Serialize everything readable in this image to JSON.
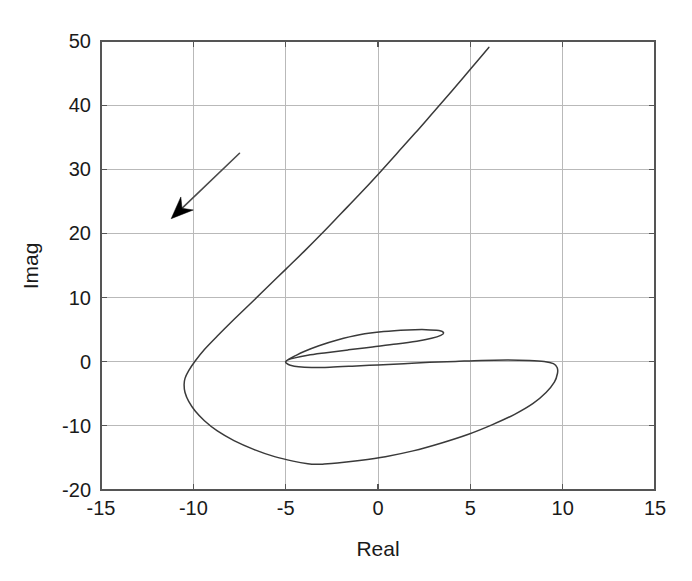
{
  "chart_data": {
    "type": "line",
    "title": "",
    "subtitle": "",
    "xlabel": "Real",
    "ylabel": "Imag",
    "xlim": [
      -15,
      15
    ],
    "ylim": [
      -20,
      50
    ],
    "xticks": [
      -15,
      -10,
      -5,
      0,
      5,
      10,
      15
    ],
    "yticks": [
      -20,
      -10,
      0,
      10,
      20,
      30,
      40,
      50
    ],
    "xtick_labels": [
      "-15",
      "-10",
      "-5",
      "0",
      "5",
      "10",
      "15"
    ],
    "ytick_labels": [
      "-20",
      "-10",
      "0",
      "10",
      "20",
      "30",
      "40",
      "50"
    ],
    "grid": true,
    "legend": null,
    "legend_position": "none",
    "curve_color": "#3a3a3a",
    "grid_color": "#b9b9b9",
    "frame_color": "#555555",
    "background_color": "#ffffff",
    "annotations": [
      {
        "name": "direction-arrow",
        "type": "arrow",
        "label": "",
        "from": [
          -7.5,
          32.5
        ],
        "to": [
          -11.2,
          22.3
        ],
        "color": "#000000"
      }
    ],
    "series": [
      {
        "name": "nyquist-locus",
        "comment": "Nyquist locus: upper tail descending from (6,49), swinging left past (-10.5,-1), around the bottom to (9.7,-1.5), then back left along a thin inner loop that closes at the cusp (-5,0).",
        "x": [
          6.0,
          5.0,
          4.0,
          3.0,
          2.0,
          1.0,
          0.0,
          -1.0,
          -2.0,
          -3.0,
          -4.0,
          -5.0,
          -6.0,
          -7.0,
          -7.9,
          -8.7,
          -9.4,
          -9.9,
          -10.25,
          -10.45,
          -10.5,
          -10.45,
          -10.25,
          -9.9,
          -9.4,
          -8.7,
          -7.8,
          -6.7,
          -5.6,
          -4.6,
          -3.8,
          -3.3,
          -3.0,
          -2.2,
          -1.0,
          0.4,
          1.9,
          3.4,
          4.9,
          6.2,
          7.4,
          8.4,
          9.1,
          9.55,
          9.72,
          9.7,
          9.5,
          9.0,
          8.2,
          7.0,
          5.6,
          4.2,
          2.8,
          1.4,
          0.0,
          -1.4,
          -2.6,
          -3.6,
          -4.3,
          -4.75,
          -4.95,
          -5.0,
          -4.85,
          -4.5,
          -4.0,
          -3.2,
          -2.2,
          -1.0,
          0.3,
          1.6,
          2.6,
          3.3,
          3.55,
          3.4,
          2.9,
          2.1,
          1.0,
          -0.3,
          -1.6,
          -2.8,
          -3.8,
          -4.5,
          -4.9,
          -5.0
        ],
        "y": [
          49.0,
          45.6,
          42.2,
          38.9,
          35.6,
          32.4,
          29.2,
          26.1,
          23.1,
          20.1,
          17.2,
          14.4,
          11.6,
          8.8,
          6.3,
          4.0,
          1.9,
          0.1,
          -1.4,
          -2.6,
          -3.6,
          -4.8,
          -6.2,
          -7.7,
          -9.2,
          -10.8,
          -12.3,
          -13.7,
          -14.8,
          -15.5,
          -15.9,
          -16.0,
          -15.97,
          -15.8,
          -15.4,
          -14.8,
          -13.9,
          -12.7,
          -11.3,
          -9.8,
          -8.2,
          -6.5,
          -4.8,
          -3.2,
          -1.8,
          -0.9,
          -0.3,
          0.05,
          0.2,
          0.25,
          0.2,
          0.05,
          -0.1,
          -0.3,
          -0.5,
          -0.7,
          -0.85,
          -0.9,
          -0.8,
          -0.55,
          -0.25,
          0.0,
          0.35,
          0.9,
          1.6,
          2.5,
          3.4,
          4.2,
          4.7,
          4.95,
          5.0,
          4.85,
          4.5,
          4.1,
          3.65,
          3.2,
          2.75,
          2.3,
          1.85,
          1.4,
          1.0,
          0.6,
          0.25,
          0.0
        ]
      }
    ]
  },
  "axis": {
    "x_title": "Real",
    "y_title": "Imag"
  }
}
